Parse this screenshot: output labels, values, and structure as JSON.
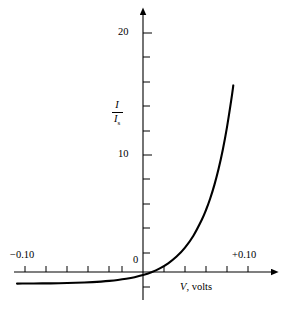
{
  "figure": {
    "background_color": "#ffffff",
    "line_color": "#000000",
    "axis_color": "#000000"
  },
  "axes": {
    "x": {
      "title_italic": "V",
      "title_rest": ", volts",
      "origin_label": "0",
      "tick_labels": [
        {
          "text": "−0.10",
          "value": -0.1
        },
        {
          "text": "+0.10",
          "value": 0.1
        }
      ]
    },
    "y": {
      "title_numerator": "I",
      "title_denominator": "I",
      "title_denominator_sub": "s",
      "tick_labels": [
        {
          "text": "20",
          "value": 20
        },
        {
          "text": "10",
          "value": 10
        }
      ]
    }
  },
  "chart_data": {
    "type": "line",
    "title": "",
    "subtitle": "",
    "xlabel": "V, volts",
    "ylabel": "I/I_s",
    "xlim": [
      -0.122,
      0.128
    ],
    "ylim": [
      -1.8,
      22.5
    ],
    "grid": false,
    "legend": null,
    "annotations": [],
    "x_ticks": [
      -0.1,
      -0.08,
      -0.06,
      -0.04,
      -0.02,
      0.0,
      0.02,
      0.04,
      0.06,
      0.08,
      0.1
    ],
    "x_tick_labels": [
      "−0.10",
      "",
      "",
      "",
      "",
      "0",
      "",
      "",
      "",
      "",
      "+0.10"
    ],
    "y_ticks": [
      -2,
      0,
      2,
      4,
      6,
      8,
      10,
      12,
      14,
      16,
      18,
      20,
      22
    ],
    "y_tick_labels": [
      "",
      "",
      "",
      "",
      "",
      "",
      "10",
      "",
      "",
      "",
      "",
      "20",
      ""
    ],
    "series": [
      {
        "name": "I/I_s = exp(V/V_T) - 1",
        "x": [
          -0.12,
          -0.112,
          -0.104,
          -0.096,
          -0.088,
          -0.08,
          -0.072,
          -0.064,
          -0.056,
          -0.048,
          -0.04,
          -0.032,
          -0.024,
          -0.016,
          -0.008,
          0.0,
          0.008,
          0.016,
          0.024,
          0.032,
          0.04,
          0.048,
          0.056,
          0.06,
          0.064,
          0.068,
          0.072,
          0.076,
          0.08,
          0.084,
          0.086
        ],
        "y": [
          -0.991,
          -0.987,
          -0.982,
          -0.976,
          -0.968,
          -0.957,
          -0.943,
          -0.924,
          -0.899,
          -0.866,
          -0.821,
          -0.762,
          -0.684,
          -0.58,
          -0.442,
          -0.259,
          -0.015,
          0.31,
          0.743,
          1.318,
          2.084,
          3.105,
          4.465,
          5.298,
          6.284,
          7.448,
          8.824,
          10.454,
          12.383,
          14.663,
          15.947
        ],
        "note": "Shockley diode equation, V_T ≈ 0.0259 V at room temperature"
      }
    ]
  }
}
